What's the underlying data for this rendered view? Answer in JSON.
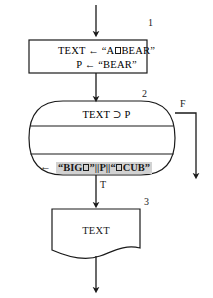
{
  "diagram": {
    "type": "flowchart",
    "title": "",
    "nodes": [
      {
        "id": "assign",
        "step_number": "1",
        "shape": "process-rectangle",
        "lines": [
          "TEXT ← \"A□BEAR\"",
          "P ← \"BEAR\""
        ],
        "line1_prefix": "TEXT ← “A",
        "line1_suffix": "BEAR”",
        "line2": "P ← “BEAR”"
      },
      {
        "id": "loop",
        "step_number": "2",
        "shape": "rounded-loop",
        "condition": "TEXT ⊃ P",
        "body_assign_arrow": "←",
        "body_expression_parts": {
          "p1": "“BIG",
          "p2": "”||P||“",
          "p3": "CUB”"
        },
        "body_expression": "“BIG□”||P||“□CUB”"
      },
      {
        "id": "output",
        "step_number": "3",
        "shape": "document",
        "text": "TEXT"
      }
    ],
    "edge_labels": {
      "false": "F",
      "true": "T"
    },
    "colors": {
      "stroke": "#1a1a1a",
      "background": "#ffffff",
      "highlight": "#d2d2d2"
    }
  }
}
